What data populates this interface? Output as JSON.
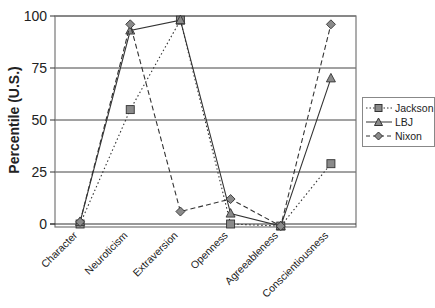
{
  "chart_data": {
    "type": "line",
    "title": "",
    "xlabel": "",
    "ylabel": "Percentile (U.S.)",
    "ylim": [
      0,
      100
    ],
    "yticks": [
      0,
      25,
      50,
      75,
      100
    ],
    "grid": true,
    "legend_position": "right",
    "categories": [
      "Character",
      "Neuroticism",
      "Extraversion",
      "Openness",
      "Agreeableness",
      "Conscientiousness"
    ],
    "series": [
      {
        "name": "Jackson",
        "marker": "square",
        "line": "dotted",
        "values": [
          0,
          55,
          98,
          0,
          -1,
          29
        ]
      },
      {
        "name": "LBJ",
        "marker": "triangle",
        "line": "solid",
        "values": [
          1,
          93,
          98,
          5,
          -1,
          70
        ]
      },
      {
        "name": "Nixon",
        "marker": "diamond",
        "line": "dashed",
        "values": [
          1,
          96,
          6,
          12,
          -1,
          96
        ]
      }
    ]
  },
  "colors": {
    "line": "#333333",
    "marker_fill": "#8a8a8a",
    "grid": "#444444",
    "frame": "#777777"
  }
}
